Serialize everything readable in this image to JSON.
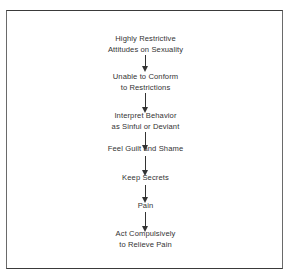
{
  "diagram": {
    "type": "flowchart",
    "direction": "top-to-bottom",
    "nodes": [
      {
        "id": "n1",
        "lines": [
          "Highly Restrictive",
          "Attitudes on Sexuality"
        ]
      },
      {
        "id": "n2",
        "lines": [
          "Unable to Conform",
          "to Restrictions"
        ]
      },
      {
        "id": "n3",
        "lines": [
          "Interpret Behavior",
          "as Sinful or Deviant"
        ]
      },
      {
        "id": "n4",
        "lines": [
          "Feel Guilt and Shame"
        ]
      },
      {
        "id": "n5",
        "lines": [
          "Keep Secrets"
        ]
      },
      {
        "id": "n6",
        "lines": [
          "Pain"
        ]
      },
      {
        "id": "n7",
        "lines": [
          "Act Compulsively",
          "to Relieve Pain"
        ]
      }
    ],
    "edges": [
      {
        "from": "n1",
        "to": "n2"
      },
      {
        "from": "n2",
        "to": "n3"
      },
      {
        "from": "n3",
        "to": "n4"
      },
      {
        "from": "n4",
        "to": "n5"
      },
      {
        "from": "n5",
        "to": "n6"
      },
      {
        "from": "n6",
        "to": "n7"
      }
    ]
  },
  "colors": {
    "line": "#333333",
    "text": "#333333",
    "background": "#ffffff"
  }
}
